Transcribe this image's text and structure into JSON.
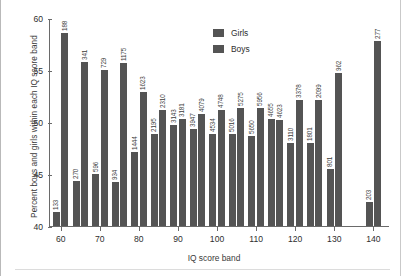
{
  "chart_data": {
    "type": "bar",
    "title": "",
    "xlabel": "IQ score band",
    "ylabel": "Percent boys and girls within each IQ score band",
    "categories": [
      60,
      65,
      70,
      75,
      80,
      85,
      90,
      95,
      100,
      105,
      110,
      115,
      120,
      125,
      130,
      140
    ],
    "xticks": [
      60,
      70,
      80,
      90,
      100,
      110,
      120,
      130,
      140
    ],
    "yticks": [
      40,
      45,
      50,
      55,
      60
    ],
    "ylim": [
      40,
      60
    ],
    "grid": false,
    "legend_position": "upper-center",
    "series": [
      {
        "name": "Girls",
        "values": [
          41.3,
          44.3,
          45.0,
          44.2,
          47.1,
          48.8,
          49.7,
          49.3,
          48.8,
          48.8,
          48.7,
          50.3,
          48.0,
          48.0,
          45.5,
          42.3
        ],
        "counts": [
          133,
          270,
          596,
          934,
          1444,
          2195,
          3143,
          3947,
          4534,
          5016,
          5650,
          4655,
          3110,
          1801,
          801,
          203
        ]
      },
      {
        "name": "Boys",
        "values": [
          58.6,
          55.8,
          55.0,
          55.7,
          52.9,
          51.2,
          50.3,
          50.8,
          51.2,
          51.3,
          51.3,
          50.2,
          52.1,
          52.1,
          54.7,
          57.8
        ],
        "counts": [
          188,
          341,
          729,
          1175,
          1623,
          2310,
          3181,
          4079,
          4748,
          5275,
          5956,
          4623,
          3378,
          2099,
          962,
          277
        ]
      }
    ]
  },
  "legend": {
    "girls_label": "Girls",
    "boys_label": "Boys"
  },
  "colors": {
    "bar": "#545454",
    "axis": "#6a6a6a",
    "text": "#2e2e2e"
  }
}
